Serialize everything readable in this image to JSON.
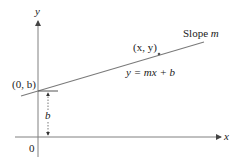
{
  "diagram": {
    "axes": {
      "x_label": "x",
      "y_label": "y",
      "origin_label": "0"
    },
    "line": {
      "slope_label_prefix": "Slope ",
      "slope_symbol": "m",
      "equation": "y = mx + b"
    },
    "points": {
      "intercept_label": "(0, b)",
      "general_point_label": "(x, y)"
    },
    "dimension": {
      "label": "b"
    },
    "colors": {
      "axis": "#808080",
      "line": "#7a7a7a",
      "text": "#222222"
    }
  }
}
